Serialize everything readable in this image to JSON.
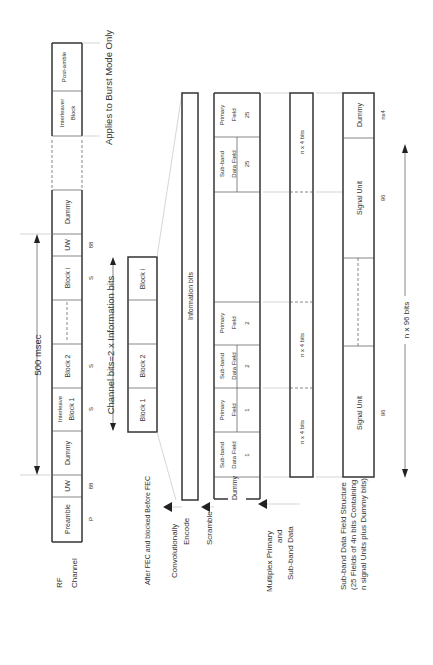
{
  "rf_channel": {
    "label_line1": "RF",
    "label_line2": "Channel",
    "duration_label": "500 msec",
    "fields": [
      {
        "label": "Preamble",
        "sub": "P"
      },
      {
        "label": "UW",
        "sub": "88"
      },
      {
        "label": "Dummy",
        "sub": ""
      },
      {
        "label_line1": "Interleave",
        "label_line2": "Block 1",
        "sub": "S"
      },
      {
        "label": "Block 2",
        "sub": "S"
      },
      {
        "label": "Block i",
        "sub": "S"
      },
      {
        "label": "UW",
        "sub": "88"
      },
      {
        "label": "Dummy",
        "sub": ""
      },
      {
        "label_line1": "Interleaver",
        "label_line2": "Block",
        "sub": ""
      },
      {
        "label": "Post-amble",
        "sub": ""
      }
    ],
    "burst_note": "Applies to Burst Mode Only"
  },
  "fec_row": {
    "label": "After FEC and blocked Before FEC",
    "channel_bits_label": "Channel bits=2 x Information bits",
    "blocks": [
      "Block 1",
      "Block 2",
      "Block i"
    ]
  },
  "encode_row": {
    "label_line1": "Convolutionally",
    "label_line2": "Encode",
    "content": "Information bits"
  },
  "scramble_row": {
    "label": "Scramble",
    "fields": [
      {
        "line1": "",
        "line2": "Dummy",
        "line3": ""
      },
      {
        "line1": "Sub-band",
        "line2": "Data Field",
        "line3": "1"
      },
      {
        "line1": "Primary",
        "line2": "Field",
        "line3": "1"
      },
      {
        "line1": "Sub-band",
        "line2": "Data Field",
        "line3": "2"
      },
      {
        "line1": "Primary",
        "line2": "Field",
        "line3": "2"
      },
      {
        "line1": "Sub-band",
        "line2": "Data Field",
        "line3": "25"
      },
      {
        "line1": "Primary",
        "line2": "Field",
        "line3": "25"
      }
    ]
  },
  "multiplex_row": {
    "label_line1": "Multiplex Primary",
    "label_line2": "and",
    "label_line3": "Sub-band Data",
    "segments": [
      "n x 4 bits",
      "n x 4 bits",
      "n x 4 bits"
    ]
  },
  "subband_row": {
    "label_line1": "Sub-band Data Field Structure",
    "label_line2": "(25 Fields of 4n bits Containing",
    "label_line3": "n signal Units plus Dummy bits)",
    "units": [
      {
        "label": "Signal Unit",
        "bits": "96"
      },
      {
        "label": "Signal Unit",
        "bits": "96"
      },
      {
        "label": "Dummy",
        "bits": "nx4"
      }
    ],
    "total_label": "n x 96 bits"
  }
}
